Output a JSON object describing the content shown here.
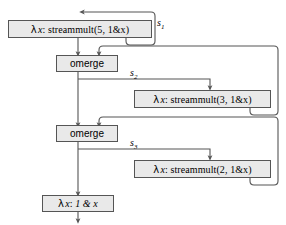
{
  "figure": {
    "type": "dataflow-diagram",
    "background_color": "#ffffff",
    "node_fill_color": "#e9e9e9",
    "node_border_color": "#555555",
    "edge_color": "#555555"
  },
  "nodes": {
    "streammult5": {
      "name": "streammult-5-box",
      "lambda": "λ",
      "var": "x",
      "colon": ":",
      "body": "streammult(5, 1&x)",
      "full_text": "λ x: streammult(5, 1&x)"
    },
    "omerge1": {
      "name": "omerge-box-1",
      "label": "omerge"
    },
    "streammult3": {
      "name": "streammult-3-box",
      "lambda": "λ",
      "var": "x",
      "colon": ":",
      "body": "streammult(3, 1&x)",
      "full_text": "λ x: streammult(3, 1&x)"
    },
    "omerge2": {
      "name": "omerge-box-2",
      "label": "omerge"
    },
    "streammult2": {
      "name": "streammult-2-box",
      "lambda": "λ",
      "var": "x",
      "colon": ":",
      "body": "streammult(2, 1&x)",
      "full_text": "λ x: streammult(2, 1&x)"
    },
    "onestream": {
      "name": "one-and-x-box",
      "lambda": "λ",
      "var": "x",
      "colon": ":",
      "body": "1 & x",
      "full_text": "λ x: 1 & x"
    }
  },
  "edge_labels": {
    "s1": {
      "base": "s",
      "sub": "1"
    },
    "s2": {
      "base": "s",
      "sub": "2"
    },
    "s3": {
      "base": "s",
      "sub": "3"
    }
  }
}
